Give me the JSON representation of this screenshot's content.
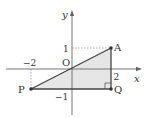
{
  "diagram": {
    "type": "coordinate-plane-triangle",
    "axes": {
      "x_label": "x",
      "y_label": "y",
      "origin_label": "O"
    },
    "tick_labels": {
      "x_neg2": "−2",
      "x_pos2": "2",
      "y_pos1": "1",
      "y_neg1": "−1"
    },
    "points": [
      {
        "name": "A",
        "x": 2,
        "y": 1
      },
      {
        "name": "P",
        "x": -2,
        "y": -1
      },
      {
        "name": "Q",
        "x": 2,
        "y": -1
      },
      {
        "name": "O",
        "x": 0,
        "y": 0
      }
    ],
    "point_labels": {
      "A": "A",
      "P": "P",
      "Q": "Q"
    },
    "shaded_region": "triangle APQ",
    "right_angle_at": "Q",
    "colors": {
      "axis": "#555555",
      "line": "#444444",
      "fill": "#e6e6e6",
      "dashed": "#999999",
      "point": "#333333"
    }
  }
}
